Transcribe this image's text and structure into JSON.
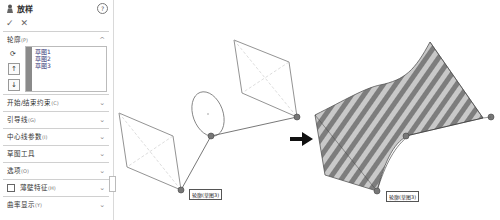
{
  "panel": {
    "title": "放样",
    "help_icon": "?",
    "ok_icon": "✓",
    "cancel_icon": "✕",
    "profiles_section": {
      "label": "轮廓",
      "hint": "(P)",
      "items": [
        "草图1",
        "草图2",
        "草图3"
      ]
    },
    "sections": [
      {
        "label": "开始/结束约束",
        "hint": "(C)"
      },
      {
        "label": "引导线",
        "hint": "(G)"
      },
      {
        "label": "中心线参数",
        "hint": "(I)"
      },
      {
        "label": "草图工具",
        "hint": ""
      },
      {
        "label": "选项",
        "hint": "(O)"
      },
      {
        "label": "薄壁特征",
        "hint": "(H)",
        "checkbox": false
      },
      {
        "label": "曲率显示",
        "hint": "(Y)"
      }
    ]
  },
  "viewport": {
    "left_label": "轮廓(草图3)",
    "right_label": "轮廓(草图3)",
    "arrow": "➡"
  }
}
